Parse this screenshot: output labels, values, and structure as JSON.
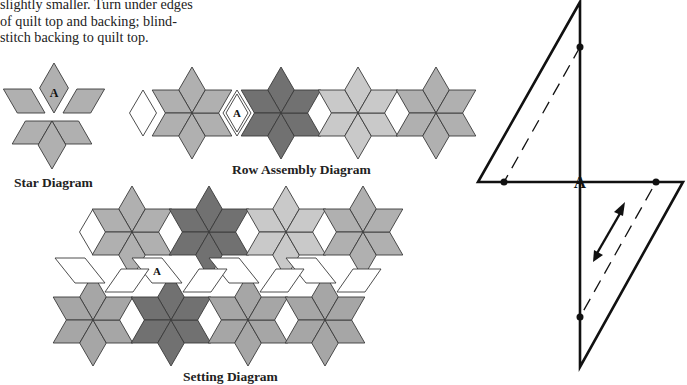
{
  "instructions": {
    "lines": [
      "slightly smaller. Turn under edges",
      "of quilt top and backing; blind-",
      "stitch backing to quilt top."
    ]
  },
  "captions": {
    "star": "Star Diagram",
    "row": "Row Assembly Diagram",
    "setting": "Setting Diagram"
  },
  "piece_label": "A",
  "colors": {
    "light": "#c9c9c9",
    "medium": "#b0b0b0",
    "mid2": "#a6a6a6",
    "dark": "#717171",
    "white": "#ffffff",
    "stroke": "#3a3a3a"
  },
  "row_assembly": {
    "stars": [
      {
        "cx": 192,
        "cy": 113,
        "shade": "medium"
      },
      {
        "cx": 281,
        "cy": 113,
        "shade": "dark"
      },
      {
        "cx": 358,
        "cy": 113,
        "shade": "light"
      },
      {
        "cx": 436,
        "cy": 113,
        "shade": "medium"
      }
    ],
    "white_diamonds": [
      {
        "cx": 143,
        "cy": 113,
        "label": false
      },
      {
        "cx": 237,
        "cy": 113,
        "label": true
      },
      {
        "cx": 319.5,
        "cy": 113,
        "label": false
      },
      {
        "cx": 397,
        "cy": 113,
        "label": false
      }
    ]
  },
  "setting": {
    "top_stars": [
      {
        "cx": 132,
        "cy": 232,
        "shade": "medium"
      },
      {
        "cx": 209,
        "cy": 232,
        "shade": "dark"
      },
      {
        "cx": 286,
        "cy": 232,
        "shade": "light"
      },
      {
        "cx": 363,
        "cy": 232,
        "shade": "medium"
      }
    ],
    "bottom_stars": [
      {
        "cx": 93,
        "cy": 320,
        "shade": "mid2"
      },
      {
        "cx": 171,
        "cy": 320,
        "shade": "dark"
      },
      {
        "cx": 248,
        "cy": 320,
        "shade": "mid2"
      },
      {
        "cx": 325,
        "cy": 320,
        "shade": "mid2"
      }
    ]
  },
  "template": {
    "label": "A",
    "arrow": "grainline"
  }
}
